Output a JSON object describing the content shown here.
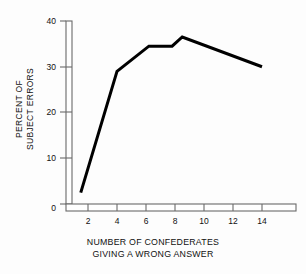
{
  "chart_data": {
    "type": "line",
    "title": "",
    "subtitle": "",
    "xlabel_line1": "NUMBER OF CONFEDERATES",
    "xlabel_line2": "GIVING A WRONG ANSWER",
    "ylabel_line1": "PERCENT OF",
    "ylabel_line2": "SUBJECT ERRORS",
    "xlim": [
      0,
      16
    ],
    "ylim": [
      0,
      40
    ],
    "xticks": [
      2,
      4,
      6,
      8,
      10,
      12,
      14
    ],
    "yticks": [
      0,
      10,
      20,
      30,
      40
    ],
    "xticklabels": [
      "2",
      "4",
      "6",
      "8",
      "10",
      "12",
      "14"
    ],
    "yticklabels": [
      "0",
      "10",
      "20",
      "30",
      "40"
    ],
    "grid": false,
    "legend": false,
    "legend_position": "none",
    "line_color": "#000000",
    "line_width": 3,
    "axis_color": "#555555",
    "background": "#ffffff",
    "series": [
      {
        "name": "Percent of subject errors",
        "x": [
          1.5,
          4,
          6.2,
          7.8,
          8.5,
          14
        ],
        "values": [
          2.5,
          29,
          34.5,
          34.5,
          36.5,
          30
        ]
      }
    ],
    "annotations": []
  },
  "axes": {
    "y_axis_name": "percent-of-subject-errors-axis",
    "x_axis_name": "number-of-confederates-axis"
  }
}
